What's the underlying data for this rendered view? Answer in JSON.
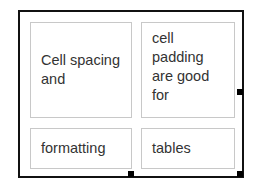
{
  "table": {
    "rows": [
      {
        "cells": [
          {
            "text": "Cell spacing and"
          },
          {
            "text": "cell padding are good for"
          }
        ]
      },
      {
        "cells": [
          {
            "text": "formatting"
          },
          {
            "text": "tables"
          }
        ]
      }
    ],
    "border_color": "#111111",
    "cell_border_color": "#c8c8c8",
    "text_color": "#333333",
    "resize_handles": [
      "right-middle",
      "bottom-middle",
      "bottom-right"
    ]
  }
}
